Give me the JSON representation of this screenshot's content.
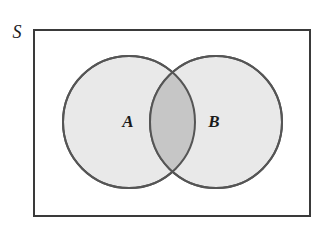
{
  "figure": {
    "type": "venn-diagram",
    "background_color": "#ffffff",
    "width": 332,
    "height": 233
  },
  "universe": {
    "label": "S",
    "label_x": 17,
    "label_y": 34,
    "rect": {
      "x": 33,
      "y": 29,
      "width": 278,
      "height": 188,
      "stroke_color": "#3a3a3a",
      "stroke_width": 2,
      "fill_color": "#ffffff"
    }
  },
  "sets": [
    {
      "id": "A",
      "label": "A",
      "cx": 129,
      "cy": 122,
      "r": 66,
      "fill_color": "#e9e9e9",
      "stroke_color": "#555555",
      "stroke_width": 2,
      "label_x": 128,
      "label_y": 123
    },
    {
      "id": "B",
      "label": "B",
      "cx": 216,
      "cy": 122,
      "r": 66,
      "fill_color": "#e9e9e9",
      "stroke_color": "#555555",
      "stroke_width": 2,
      "label_x": 214,
      "label_y": 123
    }
  ],
  "intersection": {
    "id": "A-intersect-B",
    "label": "",
    "fill_color": "#c6c6c6",
    "left_x": 152,
    "right_x": 193,
    "top_y": 71,
    "bottom_y": 173
  }
}
